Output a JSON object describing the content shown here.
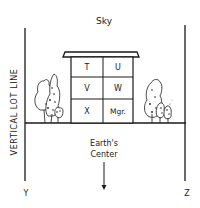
{
  "diagram": {
    "top_label": "Sky",
    "vertical_label": "VERTICAL LOT LINE",
    "center_label_line1": "Earth's",
    "center_label_line2": "Center",
    "left_corner_label": "Y",
    "right_corner_label": "Z",
    "units": [
      {
        "label": "T"
      },
      {
        "label": "U"
      },
      {
        "label": "V"
      },
      {
        "label": "W"
      },
      {
        "label": "X"
      },
      {
        "label": "Mgr."
      }
    ],
    "colors": {
      "ink": "#1a1a1a",
      "background": "#ffffff"
    }
  }
}
